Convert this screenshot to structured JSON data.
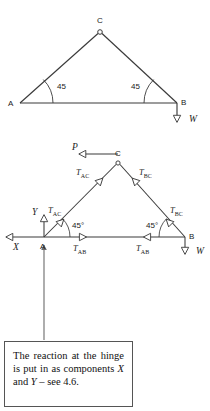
{
  "figure": {
    "diagram1": {
      "name": "pin-jointed-triangle-loaded",
      "vertices": {
        "A": {
          "label": "A",
          "x": 20,
          "y": 103
        },
        "B": {
          "label": "B",
          "x": 177,
          "y": 103
        },
        "C": {
          "label": "C",
          "x": 100,
          "y": 32
        }
      },
      "angles": [
        {
          "label": "45",
          "at": "A",
          "value": 45
        },
        {
          "label": "45",
          "at": "B",
          "value": 45
        }
      ],
      "loads": [
        {
          "label": "W",
          "at": "B",
          "direction": "down"
        }
      ],
      "hinge_at": "C"
    },
    "diagram2": {
      "name": "free-body-diagram-joint-forces",
      "vertices": {
        "A": {
          "label": "A",
          "x": 44,
          "y": 237
        },
        "B": {
          "label": "B",
          "x": 185,
          "y": 237
        },
        "C": {
          "label": "C",
          "x": 118,
          "y": 163
        }
      },
      "angles": [
        {
          "label": "45°",
          "at": "A",
          "value": 45
        },
        {
          "label": "45°",
          "at": "B",
          "value": 45
        }
      ],
      "forces": [
        {
          "label": "P",
          "member": "at-C",
          "direction": "left"
        },
        {
          "label": "W",
          "member": "at-B",
          "direction": "down"
        },
        {
          "label": "X",
          "member": "reaction-at-A",
          "direction": "left"
        },
        {
          "label": "Y",
          "member": "reaction-at-A",
          "direction": "up"
        }
      ],
      "tensions": [
        {
          "text": "T",
          "sub": "AC",
          "member": "AC",
          "end": "upper"
        },
        {
          "text": "T",
          "sub": "BC",
          "member": "BC",
          "end": "upper"
        },
        {
          "text": "T",
          "sub": "AC",
          "member": "AC",
          "end": "lower"
        },
        {
          "text": "T",
          "sub": "BC",
          "member": "BC",
          "end": "lower"
        },
        {
          "text": "T",
          "sub": "AB",
          "member": "AB",
          "end": "left"
        },
        {
          "text": "T",
          "sub": "AB",
          "member": "AB",
          "end": "right"
        }
      ]
    },
    "callout": {
      "name": "reaction-note",
      "line1": "The reaction at the",
      "line2": "hinge is put in as",
      "line3_a": "components ",
      "line3_x": "X",
      "line3_b": " and",
      "line4_y": "Y",
      "line4_b": " – see 4.6.",
      "leader": {
        "from_y": 338,
        "to_y": 263,
        "x": 44
      }
    },
    "colors": {
      "line": "#3a3a3a",
      "text": "#1a1a1a",
      "box_border": "#555555",
      "background": "#ffffff"
    }
  }
}
